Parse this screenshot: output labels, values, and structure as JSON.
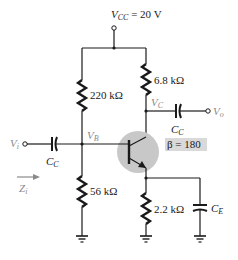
{
  "diagram": {
    "type": "common-emitter BJT amplifier (voltage-divider bias, bypassed emitter)",
    "supply": {
      "label": "V",
      "sub": "CC",
      "value": " = 20 V"
    },
    "resistors": {
      "r1": "220 kΩ",
      "r2": "56 kΩ",
      "rc": "6.8 kΩ",
      "re": "2.2 kΩ"
    },
    "capacitors": {
      "input": {
        "label": "C",
        "sub": "C"
      },
      "output": {
        "label": "C",
        "sub": "C"
      },
      "bypass": {
        "label": "C",
        "sub": "E"
      }
    },
    "nodes": {
      "vb": {
        "label": "V",
        "sub": "B"
      },
      "vc": {
        "label": "V",
        "sub": "C"
      }
    },
    "terminals": {
      "input": {
        "label": "V",
        "sub": "i"
      },
      "output": {
        "label": "V",
        "sub": "o"
      }
    },
    "impedance": {
      "label": "Z",
      "sub": "i"
    },
    "transistor": {
      "beta_label": "β = 180",
      "type": "NPN"
    },
    "colors": {
      "wire": "#1a1a1a",
      "transistor_highlight": "#c8c8c8",
      "beta_box": "#d9d9d9",
      "muted_label": "#8a8a8a"
    }
  }
}
